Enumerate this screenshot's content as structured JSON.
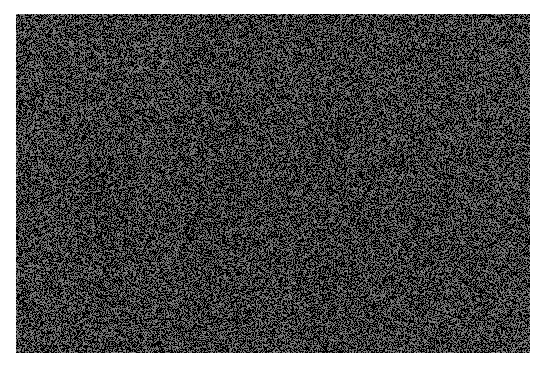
{
  "page": {
    "width": 548,
    "height": 375,
    "background_color": "#ffffff",
    "content_type": "random-noise-raster",
    "caption": ""
  },
  "noise_panel": {
    "name": "random-noise-image",
    "x": 16,
    "y": 14,
    "width": 514,
    "height": 339,
    "description": "Rectangular block of high-frequency random pixel noise",
    "palette": {
      "dark": "#000000",
      "mid": "#6a6a6a",
      "light": "#8c8c8c"
    },
    "dark_fraction": 0.52,
    "mid_fraction": 0.36,
    "light_fraction": 0.12,
    "grain_size": 1,
    "seed": 20240517,
    "vertical_streak_strength": 0.18
  },
  "chart_data": {
    "type": "heatmap",
    "title": "",
    "xlabel": "",
    "ylabel": "",
    "grid": false,
    "legend": "none",
    "x": [
      0,
      514
    ],
    "y": [
      0,
      339
    ],
    "values_description": "uniform random binary/tri-level grayscale field",
    "levels": [
      "#000000",
      "#6a6a6a",
      "#8c8c8c"
    ]
  }
}
